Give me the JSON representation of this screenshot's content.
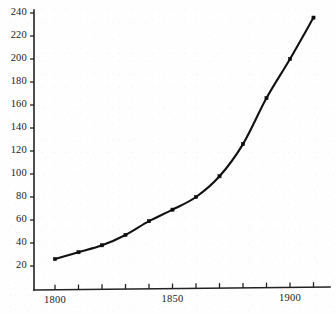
{
  "chart_data": {
    "type": "line",
    "title": "",
    "subtitle": "",
    "xlabel": "",
    "ylabel": "",
    "x": [
      1800,
      1810,
      1820,
      1830,
      1840,
      1850,
      1860,
      1870,
      1880,
      1890,
      1900,
      1910
    ],
    "values": [
      26,
      32,
      38,
      47,
      59,
      69,
      80,
      98,
      126,
      166,
      200,
      236
    ],
    "series": [
      {
        "name": "",
        "values": [
          26,
          32,
          38,
          47,
          59,
          69,
          80,
          98,
          126,
          166,
          200,
          236
        ]
      }
    ],
    "xlim": [
      1795,
      1915
    ],
    "ylim": [
      0,
      248
    ],
    "grid": false,
    "legend": false,
    "legend_position": "none",
    "marker": "square",
    "line_color": "#111111",
    "marker_color": "#0d0d0d",
    "y_ticks": [
      20,
      40,
      60,
      80,
      100,
      120,
      140,
      160,
      180,
      200,
      220,
      240
    ],
    "y_tick_labels": [
      "20",
      "40",
      "60",
      "80",
      "100",
      "120",
      "140",
      "160",
      "180",
      "200",
      "220",
      "240"
    ],
    "x_ticks": [
      1800,
      1810,
      1820,
      1830,
      1840,
      1850,
      1860,
      1870,
      1880,
      1890,
      1900,
      1910
    ],
    "x_tick_labels_shown": [
      "1800",
      "1850",
      "1900"
    ],
    "x_labeled_ticks": [
      1800,
      1850,
      1900
    ],
    "annotations": []
  },
  "axes": {
    "y_axis_name": "y-axis",
    "x_axis_name": "x-axis"
  }
}
